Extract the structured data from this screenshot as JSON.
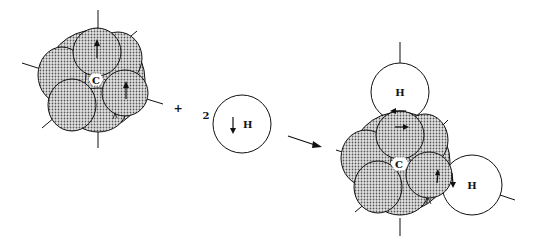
{
  "diagram": {
    "type": "chemical-reaction-orbital-diagram",
    "reactant_carbon": {
      "label": "C"
    },
    "plus_sign": "+",
    "coefficient": "2",
    "reactant_hydrogen": {
      "label": "H",
      "spin": "down-arrow"
    },
    "reaction_arrow": "→",
    "product": {
      "carbon_label": "C",
      "hydrogen_top_label": "H",
      "hydrogen_right_label": "H"
    },
    "colors": {
      "line": "#111111",
      "shade": "#c8c8c8",
      "background": "#ffffff"
    }
  }
}
